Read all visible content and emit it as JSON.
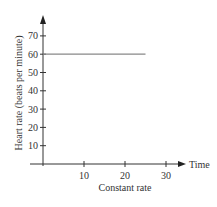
{
  "chart_data": {
    "type": "line",
    "title": "",
    "caption": "Constant rate",
    "xlabel": "Time",
    "ylabel": "Heart rate (beats per minute)",
    "x_ticks": [
      10,
      20,
      30
    ],
    "y_ticks": [
      10,
      20,
      30,
      40,
      50,
      60,
      70
    ],
    "xlim": [
      0,
      33
    ],
    "ylim": [
      0,
      75
    ],
    "grid": false,
    "legend": null,
    "series": [
      {
        "name": "Heart rate",
        "x": [
          0,
          25
        ],
        "y": [
          60,
          60
        ],
        "color": "#888888"
      }
    ]
  },
  "labels": {
    "x_axis": "Time",
    "y_axis": "Heart rate (beats per minute)",
    "caption": "Constant rate",
    "x_tick_labels": [
      "10",
      "20",
      "30"
    ],
    "y_tick_labels": [
      "10",
      "20",
      "30",
      "40",
      "50",
      "60",
      "70"
    ]
  },
  "colors": {
    "axis": "#333333",
    "line": "#888888"
  }
}
